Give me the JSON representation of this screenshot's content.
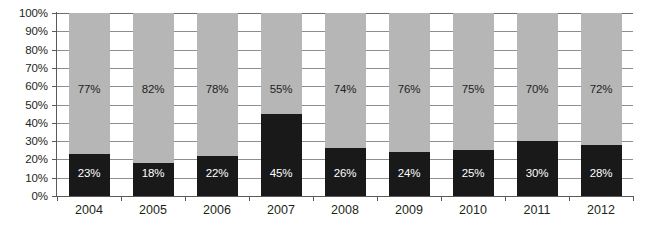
{
  "chart_data": {
    "type": "bar",
    "subtype": "100% stacked bar",
    "title": "",
    "subtitle": "",
    "xlabel": "",
    "ylabel": "",
    "ylim": [
      0,
      100
    ],
    "y_unit": "%",
    "grid": true,
    "legend_position": "none",
    "categories": [
      "2004",
      "2005",
      "2006",
      "2007",
      "2008",
      "2009",
      "2010",
      "2011",
      "2012"
    ],
    "y_ticks": [
      "0%",
      "10%",
      "20%",
      "30%",
      "40%",
      "50%",
      "60%",
      "70%",
      "80%",
      "90%",
      "100%"
    ],
    "y_tick_values": [
      0,
      10,
      20,
      30,
      40,
      50,
      60,
      70,
      80,
      90,
      100
    ],
    "series": [
      {
        "name": "bottom-series",
        "color": "#191919",
        "values": [
          23,
          18,
          22,
          45,
          26,
          24,
          25,
          30,
          28
        ],
        "labels": [
          "23%",
          "18%",
          "22%",
          "45%",
          "26%",
          "24%",
          "25%",
          "30%",
          "28%"
        ]
      },
      {
        "name": "top-series",
        "color": "#b6b6b6",
        "values": [
          77,
          82,
          78,
          55,
          74,
          76,
          75,
          70,
          72
        ],
        "labels": [
          "77%",
          "82%",
          "78%",
          "55%",
          "74%",
          "76%",
          "75%",
          "70%",
          "72%"
        ]
      }
    ]
  },
  "colors": {
    "bar_dark": "#191919",
    "bar_light": "#b6b6b6",
    "gridline": "#8d8d8d",
    "axis": "#5a5a5a",
    "text": "#231f20",
    "label_on_dark": "#ffffff",
    "background": "#ffffff"
  }
}
